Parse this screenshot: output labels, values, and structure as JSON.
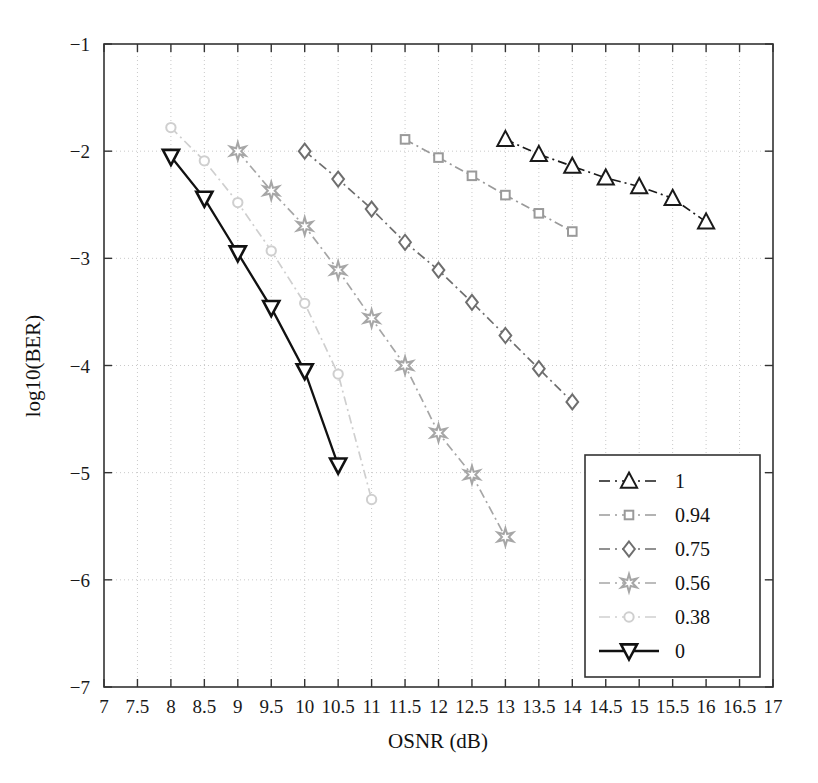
{
  "chart_data": {
    "type": "line",
    "title": "",
    "xlabel": "OSNR (dB)",
    "ylabel": "log10(BER)",
    "xlim": [
      7,
      17
    ],
    "ylim": [
      -7,
      -1
    ],
    "xticks": [
      7,
      7.5,
      8,
      8.5,
      9,
      9.5,
      10,
      10.5,
      11,
      11.5,
      12,
      12.5,
      13,
      13.5,
      14,
      14.5,
      15,
      15.5,
      16,
      16.5,
      17
    ],
    "xticklabels": [
      "7",
      "7.5",
      "8",
      "8.5",
      "9",
      "9.5",
      "10",
      "10.5",
      "11",
      "11.5",
      "12",
      "12.5",
      "13",
      "13.5",
      "14",
      "14.5",
      "15",
      "15.5",
      "16",
      "16.5",
      "17"
    ],
    "yticks": [
      -1,
      -2,
      -3,
      -4,
      -5,
      -6,
      -7
    ],
    "yticklabels": [
      "−1",
      "−2",
      "−3",
      "−4",
      "−5",
      "−6",
      "−7"
    ],
    "grid": true,
    "grid_style": "dotted",
    "legend_position": "lower-right",
    "series": [
      {
        "name": "1",
        "label": "1",
        "marker": "triangle-up",
        "color": "#1a1a1a",
        "linestyle": "dash-dot",
        "x": [
          13.0,
          13.5,
          14.0,
          14.5,
          15.0,
          15.5,
          16.0
        ],
        "y": [
          -1.89,
          -2.03,
          -2.14,
          -2.25,
          -2.33,
          -2.44,
          -2.66
        ]
      },
      {
        "name": "0.94",
        "label": "0.94",
        "marker": "square",
        "color": "#9a9a9a",
        "linestyle": "dash-dot",
        "x": [
          11.5,
          12.0,
          12.5,
          13.0,
          13.5,
          14.0
        ],
        "y": [
          -1.89,
          -2.06,
          -2.23,
          -2.41,
          -2.58,
          -2.75
        ]
      },
      {
        "name": "0.75",
        "label": "0.75",
        "marker": "diamond",
        "color": "#6e6e6e",
        "linestyle": "dash-dot",
        "x": [
          10.0,
          10.5,
          11.0,
          11.5,
          12.0,
          12.5,
          13.0,
          13.5,
          14.0
        ],
        "y": [
          -2.0,
          -2.26,
          -2.54,
          -2.85,
          -3.11,
          -3.41,
          -3.72,
          -4.03,
          -4.34
        ]
      },
      {
        "name": "0.56",
        "label": "0.56",
        "marker": "star",
        "color": "#a6a6a6",
        "linestyle": "dash-dot",
        "x": [
          9.0,
          9.5,
          10.0,
          10.5,
          11.0,
          11.5,
          12.0,
          12.5,
          13.0
        ],
        "y": [
          -2.0,
          -2.37,
          -2.7,
          -3.11,
          -3.56,
          -4.0,
          -4.63,
          -5.02,
          -5.6
        ]
      },
      {
        "name": "0.38",
        "label": "0.38",
        "marker": "circle",
        "color": "#cfcfcf",
        "linestyle": "dash-dot",
        "x": [
          8.0,
          8.5,
          9.0,
          9.5,
          10.0,
          10.5,
          11.0
        ],
        "y": [
          -1.78,
          -2.09,
          -2.48,
          -2.93,
          -3.42,
          -4.08,
          -5.25
        ]
      },
      {
        "name": "0",
        "label": "0",
        "marker": "triangle-down",
        "color": "#111111",
        "linestyle": "solid",
        "x": [
          8.0,
          8.5,
          9.0,
          9.5,
          10.0,
          10.5
        ],
        "y": [
          -2.05,
          -2.44,
          -2.95,
          -3.46,
          -4.05,
          -4.93
        ]
      }
    ]
  },
  "legend": {
    "entries": [
      {
        "label": "1"
      },
      {
        "label": "0.94"
      },
      {
        "label": "0.75"
      },
      {
        "label": "0.56"
      },
      {
        "label": "0.38"
      },
      {
        "label": "0"
      }
    ]
  }
}
